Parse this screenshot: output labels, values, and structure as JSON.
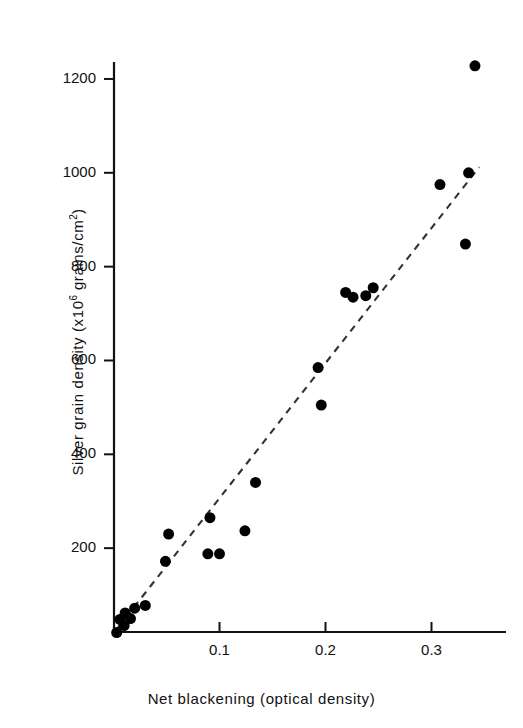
{
  "chart_data": {
    "type": "scatter",
    "title": "",
    "xlabel": "Net blackening (optical density)",
    "ylabel_parts": {
      "before": "Silver grain density (x10",
      "exponent": "6",
      "after": " grains/cm",
      "exponent2": "2",
      "close": ")"
    },
    "ylabel": "Silver grain density (x10^6 grains/cm^2)",
    "xlim": [
      0.0,
      0.355
    ],
    "ylim": [
      0,
      1310
    ],
    "xticks": [
      0.1,
      0.2,
      0.3
    ],
    "xtick_labels": [
      "0.1",
      "0.2",
      "0.3"
    ],
    "yticks": [
      200,
      400,
      600,
      800,
      1000,
      1200
    ],
    "ytick_labels": [
      "200",
      "400",
      "600",
      "800",
      "1000",
      "1200"
    ],
    "grid": false,
    "legend": false,
    "marker": "filled-circle",
    "marker_color": "#000000",
    "marker_size_px": 11,
    "points": [
      {
        "x": 0.003,
        "y": 20
      },
      {
        "x": 0.006,
        "y": 48
      },
      {
        "x": 0.01,
        "y": 35
      },
      {
        "x": 0.011,
        "y": 62
      },
      {
        "x": 0.016,
        "y": 50
      },
      {
        "x": 0.02,
        "y": 72
      },
      {
        "x": 0.03,
        "y": 78
      },
      {
        "x": 0.049,
        "y": 172
      },
      {
        "x": 0.052,
        "y": 230
      },
      {
        "x": 0.089,
        "y": 188
      },
      {
        "x": 0.091,
        "y": 265
      },
      {
        "x": 0.1,
        "y": 188
      },
      {
        "x": 0.124,
        "y": 237
      },
      {
        "x": 0.134,
        "y": 340
      },
      {
        "x": 0.193,
        "y": 585
      },
      {
        "x": 0.196,
        "y": 505
      },
      {
        "x": 0.219,
        "y": 745
      },
      {
        "x": 0.226,
        "y": 735
      },
      {
        "x": 0.238,
        "y": 738
      },
      {
        "x": 0.245,
        "y": 755
      },
      {
        "x": 0.308,
        "y": 975
      },
      {
        "x": 0.332,
        "y": 848
      },
      {
        "x": 0.335,
        "y": 1000
      },
      {
        "x": 0.341,
        "y": 1228
      }
    ],
    "fit_line": {
      "style": "dashed",
      "color": "#333333",
      "x_start": 0.004,
      "y_start": 30,
      "x_end": 0.345,
      "y_end": 1012
    },
    "axes": {
      "color": "#111111",
      "left_spine": true,
      "bottom_spine": true,
      "top_spine": false,
      "right_spine": false,
      "tick_direction": "out"
    }
  }
}
